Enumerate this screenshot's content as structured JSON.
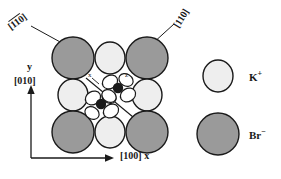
{
  "figure": {
    "background": "#ffffff",
    "ink_color": "#1a1a1a"
  },
  "direction_labels": {
    "left": {
      "text": "110",
      "overbar_on": "1",
      "display": "[̄1 1 0]",
      "raw": "[110]"
    },
    "right": {
      "text": "110",
      "overbar_on": "",
      "display": "[110]",
      "raw": "[110]"
    }
  },
  "axes": {
    "y": {
      "symbol": "y",
      "index": "[010]"
    },
    "x": {
      "index": "[100]",
      "symbol": "x"
    }
  },
  "local_axes": {
    "x": "x",
    "z": "z"
  },
  "legend": [
    {
      "name": "potassium-ion",
      "label": "K",
      "charge": "+",
      "fill": "#eeeeee",
      "radius": 15
    },
    {
      "name": "bromide-ion",
      "label": "Br",
      "charge": "−",
      "fill": "#9a9a9a",
      "radius": 21
    }
  ],
  "lattice": {
    "description": "3x3 arrangement: large Br- anions on corners, small K+ cations on edge midpoints",
    "br_fill": "#9a9a9a",
    "k_fill": "#eeeeee",
    "stroke": "#1a1a1a",
    "br_radius": 21,
    "k_radius": 15,
    "ions": [
      {
        "species": "Br",
        "cx": 73,
        "cy": 58
      },
      {
        "species": "K",
        "cx": 110,
        "cy": 58
      },
      {
        "species": "Br",
        "cx": 147,
        "cy": 58
      },
      {
        "species": "K",
        "cx": 73,
        "cy": 95
      },
      {
        "species": "K",
        "cx": 147,
        "cy": 95
      },
      {
        "species": "Br",
        "cx": 73,
        "cy": 132
      },
      {
        "species": "K",
        "cx": 110,
        "cy": 132
      },
      {
        "species": "Br",
        "cx": 147,
        "cy": 132
      }
    ]
  },
  "adsorbate": {
    "description": "Two dark atoms along the [110] diagonal, each with four orbital lobes",
    "atom_fill": "#1a1a1a",
    "lobe_fill": "#ffffff",
    "atoms": [
      {
        "cx": 118,
        "cy": 88
      },
      {
        "cx": 101,
        "cy": 104
      }
    ]
  }
}
